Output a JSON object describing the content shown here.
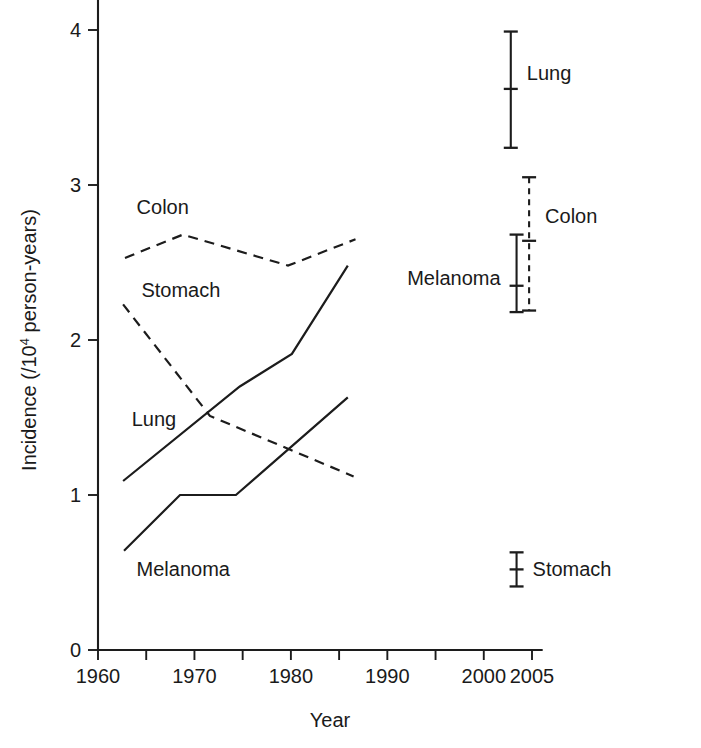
{
  "chart_data": {
    "type": "line",
    "title": "",
    "xlabel": "Year",
    "ylabel": "Incidence (/10^4 person-years)",
    "ylabel_prefix": "Incidence (/10",
    "ylabel_exponent": "4",
    "ylabel_suffix": " person-years)",
    "xlim": [
      1960,
      2006
    ],
    "ylim": [
      0,
      4.3
    ],
    "grid": false,
    "legend": "inline-labels",
    "x_ticks": [
      1960,
      1965,
      1970,
      1975,
      1980,
      1985,
      1990,
      1995,
      2000,
      2005
    ],
    "x_tick_labels": [
      {
        "value": 1960,
        "label": "1960"
      },
      {
        "value": 1970,
        "label": "1970"
      },
      {
        "value": 1980,
        "label": "1980"
      },
      {
        "value": 1990,
        "label": "1990"
      },
      {
        "value": 2000,
        "label": "2000"
      },
      {
        "value": 2005,
        "label": "2005"
      }
    ],
    "y_ticks": [
      0,
      1,
      2,
      3,
      4
    ],
    "y_tick_labels": [
      "0",
      "1",
      "2",
      "3",
      "4"
    ],
    "series": [
      {
        "name": "Colon",
        "style": "dashed",
        "label": "Colon",
        "label_x": 1964.0,
        "label_y": 2.86,
        "x": [
          1962.8,
          1968.8,
          1979.7,
          1986.7
        ],
        "values": [
          2.53,
          2.68,
          2.48,
          2.65
        ]
      },
      {
        "name": "Stomach",
        "style": "dashed",
        "label": "Stomach",
        "label_x": 1964.5,
        "label_y": 2.32,
        "x": [
          1962.6,
          1971.6,
          1986.5
        ],
        "values": [
          2.23,
          1.51,
          1.12
        ]
      },
      {
        "name": "Lung",
        "style": "solid",
        "label": "Lung",
        "label_x": 1963.5,
        "label_y": 1.49,
        "x": [
          1962.6,
          1974.7,
          1980.1,
          1985.9
        ],
        "values": [
          1.09,
          1.7,
          1.91,
          2.48
        ]
      },
      {
        "name": "Melanoma",
        "style": "solid",
        "label": "Melanoma",
        "label_x": 1964.0,
        "label_y": 0.52,
        "x": [
          1962.7,
          1968.5,
          1974.3,
          1985.9
        ],
        "values": [
          0.64,
          1.0,
          1.0,
          1.63
        ]
      }
    ],
    "error_bars": [
      {
        "name": "Lung",
        "label": "Lung",
        "style": "solid",
        "x": 2002.8,
        "value": 3.62,
        "low": 3.24,
        "high": 3.99,
        "label_side": "right",
        "label_y": 3.72
      },
      {
        "name": "Colon",
        "label": "Colon",
        "style": "dashed",
        "x": 2004.7,
        "value": 2.64,
        "low": 2.19,
        "high": 3.05,
        "label_side": "right",
        "label_y": 2.8
      },
      {
        "name": "Melanoma",
        "label": "Melanoma",
        "style": "solid",
        "x": 2003.4,
        "value": 2.35,
        "low": 2.18,
        "high": 2.68,
        "label_side": "left",
        "label_y": 2.4
      },
      {
        "name": "Stomach",
        "label": "Stomach",
        "style": "solid",
        "x": 2003.4,
        "value": 0.52,
        "low": 0.41,
        "high": 0.63,
        "label_side": "right",
        "label_y": 0.52
      }
    ],
    "colors": {
      "ink": "#1c1c1c",
      "background": "#ffffff"
    }
  }
}
